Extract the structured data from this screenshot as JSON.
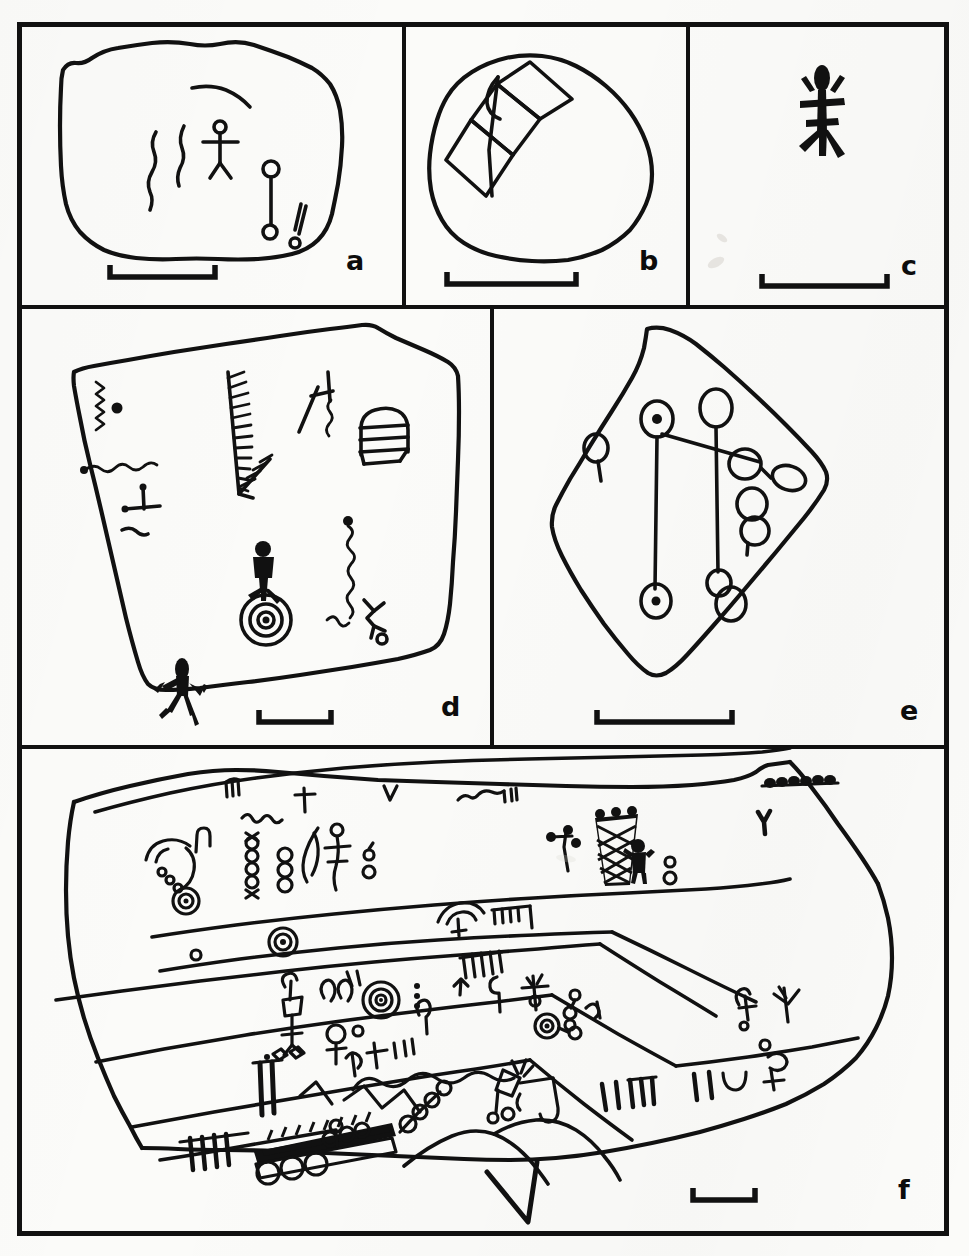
{
  "figure": {
    "type": "scientific-line-drawing-plate",
    "background_color": "#fbfbf9",
    "ink_color": "#111111",
    "frame": {
      "x": 17,
      "y": 22,
      "width": 931,
      "height": 1214,
      "border_width": 5
    },
    "panels": [
      {
        "id": "a",
        "label": "a",
        "row": 1,
        "bounds": {
          "x": 17,
          "y": 22,
          "width": 385,
          "height": 282
        },
        "label_pos": {
          "x": 352,
          "y": 248
        },
        "scale_bar": {
          "x": 110,
          "y": 277,
          "length": 105,
          "tick_height": 13
        },
        "rock_outline": "irregular rounded boulder, wide",
        "motifs": [
          "curved-arc-line",
          "wavy-vertical-line",
          "wavy-vertical-line-short",
          "stick-figure-anthropomorph",
          "circle-and-line-with-circle-terminus",
          "double-short-stroke-with-dot"
        ]
      },
      {
        "id": "b",
        "label": "b",
        "row": 1,
        "bounds": {
          "x": 406,
          "y": 22,
          "width": 282,
          "height": 282
        },
        "label_pos": {
          "x": 645,
          "y": 248
        },
        "scale_bar": {
          "x": 447,
          "y": 284,
          "length": 129,
          "tick_height": 13
        },
        "rock_outline": "rounded ovoid boulder",
        "motifs": [
          "chain-of-linked-diamonds",
          "rhombus-chain-diagonal"
        ]
      },
      {
        "id": "c",
        "label": "c",
        "row": 1,
        "bounds": {
          "x": 690,
          "y": 22,
          "width": 258,
          "height": 282
        },
        "label_pos": {
          "x": 907,
          "y": 268
        },
        "scale_bar": {
          "x": 762,
          "y": 286,
          "length": 125,
          "tick_height": 13
        },
        "rock_outline": "none",
        "motifs": [
          "solid-pecked-anthropomorph"
        ]
      },
      {
        "id": "d",
        "label": "d",
        "row": 2,
        "bounds": {
          "x": 17,
          "y": 312,
          "width": 475,
          "height": 432
        },
        "label_pos": {
          "x": 446,
          "y": 694
        },
        "scale_bar": {
          "x": 259,
          "y": 722,
          "length": 72,
          "tick_height": 13
        },
        "rock_outline": "angular slab, roughly quadrilateral",
        "motifs": [
          "zigzag-with-dot",
          "long-wavy-line",
          "small-t-shape",
          "short-wavy-stroke",
          "feathered-comb-large",
          "feathered-comb-small",
          "h-shape-with-squiggle",
          "dome-with-horizontal-bars",
          "solid-anthropomorph",
          "concentric-circles-with-dot",
          "vertical-squiggle-with-dot",
          "small-zigzag",
          "stick-figure-with-circle-foot",
          "frog-lizard-figure"
        ]
      },
      {
        "id": "e",
        "label": "e",
        "row": 2,
        "bounds": {
          "x": 492,
          "y": 312,
          "width": 456,
          "height": 432
        },
        "label_pos": {
          "x": 905,
          "y": 712
        },
        "scale_bar": {
          "x": 597,
          "y": 722,
          "length": 135,
          "tick_height": 13
        },
        "rock_outline": "diamond / lozenge shaped boulder",
        "motifs": [
          "circle-with-tail",
          "cupule-with-dot-upper",
          "cupule-plain-upper",
          "connected-cupule-chain",
          "paired-cupules",
          "cupule-with-dot-lower",
          "cupule-pair-lower"
        ]
      },
      {
        "id": "f",
        "label": "f",
        "row": 3,
        "bounds": {
          "x": 17,
          "y": 750,
          "width": 931,
          "height": 486
        },
        "label_pos": {
          "x": 903,
          "y": 1204
        },
        "scale_bar": {
          "x": 693,
          "y": 1200,
          "length": 62,
          "tick_height": 13
        },
        "rock_outline": "large multi-band cliff face with stratified ledges",
        "motifs": [
          "bead-chain-row",
          "cross-shape",
          "v-shapes",
          "wavy-connector-line",
          "crosshatched-triangle-tall",
          "solid-anthropomorph-small",
          "spiral-concentric-circles",
          "rake-comb-forms",
          "stick-figures-row",
          "serpentine-wavy-line",
          "ladder-hatch-bar",
          "large-v-motif",
          "vertical-stroke-groups",
          "circle-chains"
        ]
      }
    ]
  }
}
